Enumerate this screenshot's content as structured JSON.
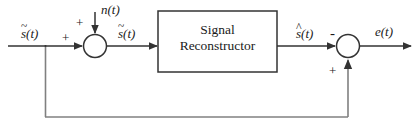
{
  "diagram": {
    "stroke_color": "#333333",
    "text_color": "#1a1a1a",
    "background_color": "#ffffff",
    "block": {
      "line1": "Signal",
      "line2": "Reconstructor"
    },
    "signals": {
      "input": {
        "base": "s",
        "accent": "~",
        "arg": "(t)",
        "full": "s̃(t)"
      },
      "noise": {
        "base": "n",
        "accent": "",
        "arg": "(t)",
        "full": "n(t)"
      },
      "noisy": {
        "base": "s",
        "accent": "~",
        "arg": "(t)",
        "full": "s̃(t)"
      },
      "reconstructed": {
        "base": "s",
        "accent": "^",
        "arg": "(t)",
        "full": "ŝ(t)"
      },
      "error": {
        "base": "e",
        "accent": "",
        "arg": "(t)",
        "full": "e(t)"
      }
    },
    "signs": {
      "sum1_input_sign": "+",
      "sum1_noise_sign": "+",
      "sum2_top_sign": "-",
      "sum2_feedback_sign": "+"
    },
    "nodes": {
      "summer_1_label": "summing-junction-1",
      "summer_2_label": "summing-junction-2",
      "feedback_tap_label": "feedback-tap-node"
    }
  }
}
